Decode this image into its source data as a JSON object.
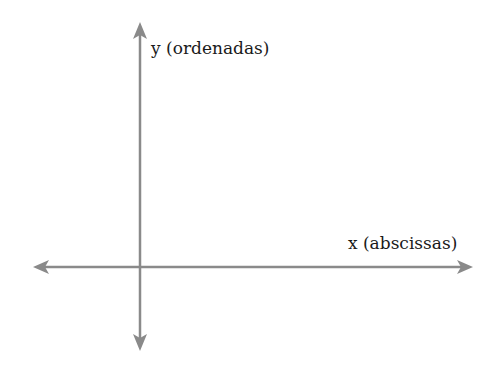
{
  "diagram": {
    "y_axis_label": "y (ordenadas)",
    "x_axis_label": "x (abscissas)",
    "axis_color": "#8a8a8a",
    "text_color": "#1a1a1a"
  }
}
